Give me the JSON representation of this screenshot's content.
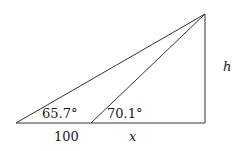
{
  "diagram": {
    "type": "right-triangle-elevation",
    "points": {
      "A": [
        16,
        123
      ],
      "B": [
        91,
        123
      ],
      "C": [
        205,
        123
      ],
      "D": [
        205,
        14
      ]
    },
    "labels": {
      "angle_outer": "65.7°",
      "angle_inner": "70.1°",
      "base_left": "100",
      "base_right": "x",
      "height": "h"
    },
    "stroke_color": "#333333",
    "text_color": "#1a1a1a"
  }
}
